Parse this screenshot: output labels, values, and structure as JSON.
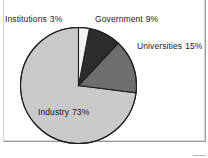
{
  "figure": {
    "background_color": "#ffffff",
    "frame_color": "#9a9a9a"
  },
  "chart_data": {
    "type": "pie",
    "title": "",
    "subtitle": "",
    "xlabel": "",
    "ylabel": "",
    "legend_position": "none",
    "labels_position": "outside-and-inside",
    "start_angle_deg": 0,
    "direction": "clockwise",
    "categories": [
      "Institutions",
      "Government",
      "Universities",
      "Industry"
    ],
    "values": [
      3,
      9,
      15,
      73
    ],
    "unit": "%",
    "colors": [
      "#f2f2f2",
      "#2d2d2d",
      "#6e6e6e",
      "#c9c9c9"
    ],
    "slice_edge_color": "#1f1f1f",
    "annotations": [
      {
        "label": "Institutions",
        "value": 3,
        "text": "Institutions  3%",
        "placement": "outside-top-left"
      },
      {
        "label": "Government",
        "value": 9,
        "text": "Government  9%",
        "placement": "outside-top-right"
      },
      {
        "label": "Universities",
        "value": 15,
        "text": "Universities  15%",
        "placement": "outside-right"
      },
      {
        "label": "Industry",
        "value": 73,
        "text": "Industry  73%",
        "placement": "inside-slice"
      }
    ]
  },
  "labels": {
    "institutions": {
      "name": "Institutions",
      "percent": "3%"
    },
    "government": {
      "name": "Government",
      "percent": "9%"
    },
    "universities": {
      "name": "Universities",
      "percent": "15%"
    },
    "industry": {
      "name": "Industry",
      "percent": "73%"
    }
  }
}
